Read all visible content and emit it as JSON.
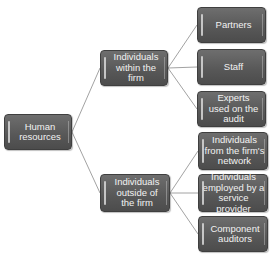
{
  "diagram": {
    "type": "hierarchy-tree",
    "root": {
      "label": "Human resources",
      "children": [
        {
          "label": "Individuals within the firm",
          "children": [
            {
              "label": "Partners"
            },
            {
              "label": "Staff"
            },
            {
              "label": "Experts used on the audit"
            }
          ]
        },
        {
          "label": "Individuals outside of the firm",
          "children": [
            {
              "label": "Individuals from the firm's network"
            },
            {
              "label": "Individuals employed by a service provider"
            },
            {
              "label": "Component auditors"
            }
          ]
        }
      ]
    },
    "colors": {
      "node_fill": "#5a5a5a",
      "node_text": "#f2f2f2",
      "connector": "#8a8a8a",
      "background": "#ffffff"
    }
  }
}
